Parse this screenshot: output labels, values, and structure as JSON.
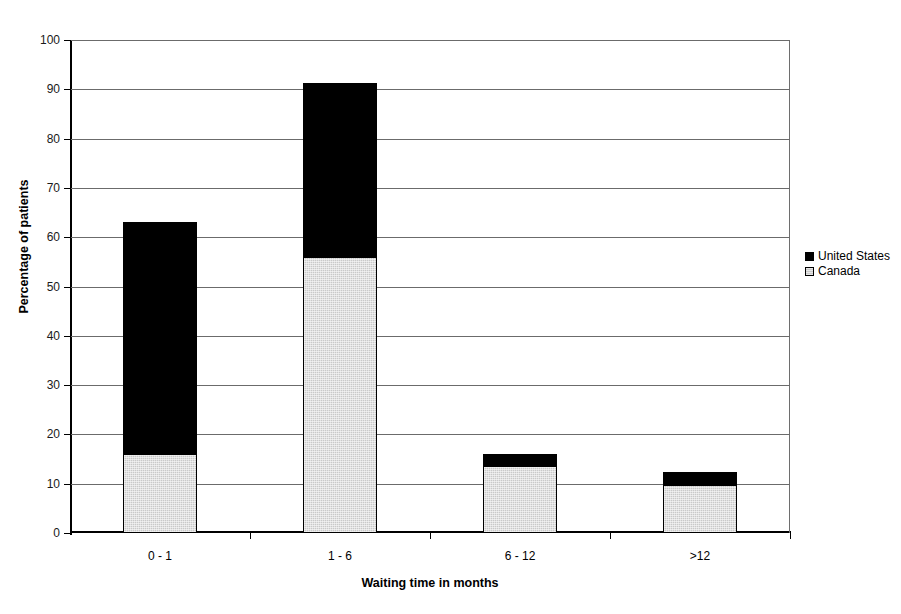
{
  "chart_data": {
    "type": "bar",
    "subtype": "stacked-vertical",
    "title": "",
    "xlabel": "Waiting time in months",
    "ylabel": "Percentage of patients",
    "categories": [
      "0 - 1",
      "1 - 6",
      "6 - 12",
      ">12"
    ],
    "series": [
      {
        "name": "Canada",
        "color": "#c9c9c9",
        "values": [
          16,
          56,
          13.5,
          9.7
        ]
      },
      {
        "name": "United States",
        "color": "#000000",
        "values": [
          47,
          35.2,
          2.6,
          2.6
        ]
      }
    ],
    "stack_totals": [
      63,
      91.2,
      16.1,
      12.3
    ],
    "stack_order": [
      "Canada",
      "United States"
    ],
    "ylim": [
      0,
      100
    ],
    "yticks": [
      0,
      10,
      20,
      30,
      40,
      50,
      60,
      70,
      80,
      90,
      100
    ],
    "ytick_labels": [
      "0",
      "10",
      "20",
      "30",
      "40",
      "50",
      "60",
      "70",
      "80",
      "90",
      "100"
    ],
    "grid": true,
    "grid_axis": "y",
    "legend_position": "right",
    "legend_entries": [
      "United States",
      "Canada"
    ]
  },
  "legend": {
    "entries": [
      {
        "label": "United States",
        "swatch": "black-square-icon"
      },
      {
        "label": "Canada",
        "swatch": "gray-square-icon"
      }
    ]
  },
  "axes": {
    "y_title": "Percentage of patients",
    "x_title": "Waiting time in months"
  }
}
